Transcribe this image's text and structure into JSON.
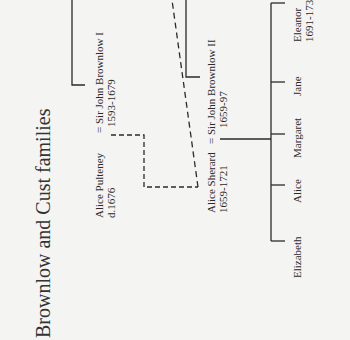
{
  "title": "Brownlow and Cust families",
  "people": {
    "john_brownlow_1": {
      "name": "= Sir John Brownlow I",
      "dates": "1593-1679"
    },
    "alice_pulteney": {
      "name": "Alice Pulteney",
      "dates": "d.1676"
    },
    "alice_sherard": {
      "name": "Alice Sherard",
      "dates": "1659-1721"
    },
    "john_brownlow_2": {
      "name": "= Sir John Brownlow II",
      "dates": "1659-97"
    },
    "children": [
      {
        "name": "Elizabeth"
      },
      {
        "name": "Alice"
      },
      {
        "name": "Margaret"
      },
      {
        "name": "Jane"
      },
      {
        "name": "Eleanor",
        "dates": "1691-173"
      }
    ]
  },
  "colors": {
    "line": "#2a2a2a",
    "background": "#f4f4f2"
  }
}
